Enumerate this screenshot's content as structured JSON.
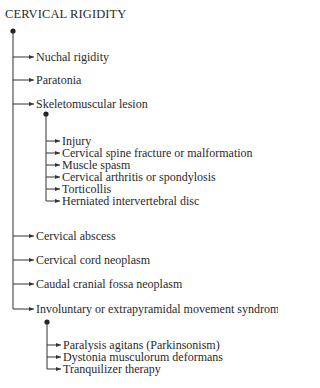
{
  "title": "CERVICAL RIGIDITY",
  "tree": {
    "root": "CERVICAL RIGIDITY",
    "branches": [
      {
        "label": "Nuchal rigidity"
      },
      {
        "label": "Paratonia"
      },
      {
        "label": "Skeletomuscular lesion",
        "children": [
          "Injury",
          "Cervical spine fracture or malformation",
          "Muscle spasm",
          "Cervical arthritis or spondylosis",
          "Torticollis",
          "Herniated intervertebral disc"
        ]
      },
      {
        "label": "Cervical abscess"
      },
      {
        "label": "Cervical cord neoplasm"
      },
      {
        "label": "Caudal cranial fossa neoplasm"
      },
      {
        "label": "Involuntary or extrapyramidal movement syndrome",
        "children": [
          "Paralysis agitans (Parkinsonism)",
          "Dystonia musculorum deformans",
          "Tranquilizer therapy"
        ]
      }
    ]
  },
  "colors": {
    "line": "#333333",
    "text": "#2a2a2a",
    "background": "#ffffff"
  }
}
